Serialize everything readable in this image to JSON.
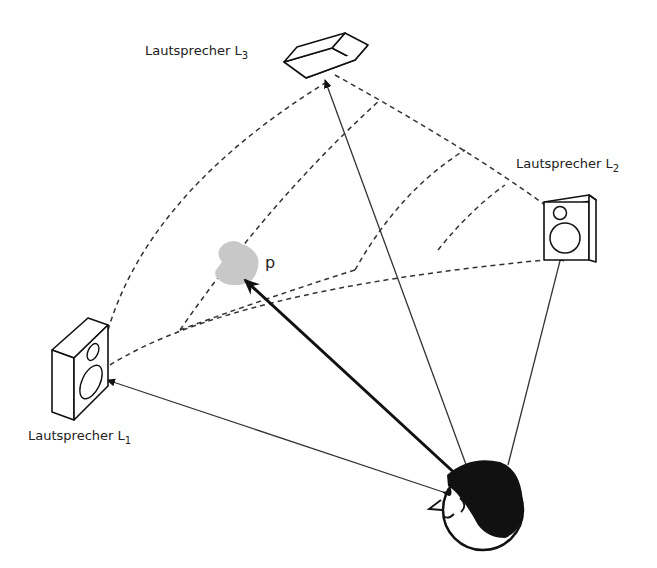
{
  "diagram": {
    "type": "spatial-audio-panning",
    "speakers": [
      {
        "id": "L1",
        "label": "Lautsprecher L",
        "subscript": "1",
        "position": "left"
      },
      {
        "id": "L2",
        "label": "Lautsprecher L",
        "subscript": "2",
        "position": "right"
      },
      {
        "id": "L3",
        "label": "Lautsprecher L",
        "subscript": "3",
        "position": "top"
      }
    ],
    "phantom_source": {
      "label": "p",
      "color": "#c8c8c8"
    },
    "listener": {
      "description": "listener-head"
    },
    "colors": {
      "line": "#333333",
      "bold_line": "#111111",
      "background": "#ffffff"
    }
  }
}
